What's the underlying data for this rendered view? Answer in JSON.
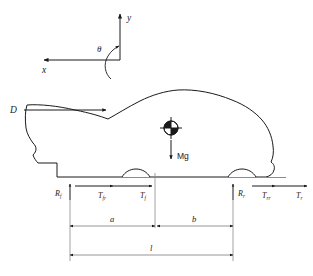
{
  "figure": {
    "background_color": "#ffffff",
    "line_color": "#1a1a1a",
    "ground_color": "#8a8a8a"
  },
  "axes": {
    "y_label": "y",
    "x_label": "x",
    "theta_label": "θ"
  },
  "forces": {
    "drag_label": "D",
    "weight_label": "Mg",
    "front_normal": {
      "base": "R",
      "sub": "f"
    },
    "rear_normal": {
      "base": "R",
      "sub": "r"
    },
    "front_rolling": {
      "base": "T",
      "sub": "fr"
    },
    "front_traction": {
      "base": "T",
      "sub": "f"
    },
    "rear_rolling": {
      "base": "T",
      "sub": "rr"
    },
    "rear_traction": {
      "base": "T",
      "sub": "r"
    }
  },
  "dimensions": {
    "a_label": "a",
    "b_label": "b",
    "l_label": "l"
  }
}
